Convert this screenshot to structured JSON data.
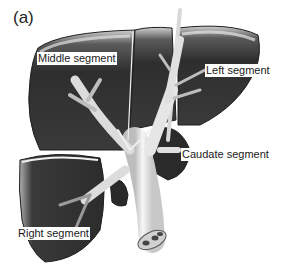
{
  "figure": {
    "panel_label": "(a)",
    "labels": {
      "middle": "Middle segment",
      "left": "Left segment",
      "caudate": "Caudate segment",
      "right": "Right segment"
    },
    "colors": {
      "background": "#ffffff",
      "lobe_dark": "#2e2e2e",
      "lobe_highlight": "#bdbdbd",
      "vessel": "#e8e8e8",
      "vessel_shadow": "#9a9a9a",
      "text": "#1a1a1a"
    }
  }
}
